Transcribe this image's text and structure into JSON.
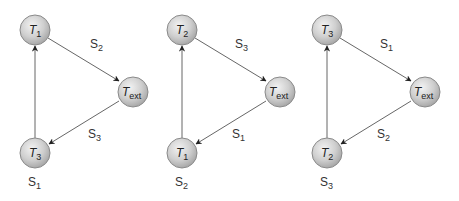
{
  "diagrams": [
    {
      "top": {
        "main": "T",
        "sub": "1"
      },
      "ext": {
        "main": "T",
        "sub": "ext"
      },
      "bottom": {
        "main": "T",
        "sub": "3"
      },
      "edge_top_ext": {
        "main": "S",
        "sub": "2"
      },
      "edge_ext_bottom": {
        "main": "S",
        "sub": "3"
      },
      "edge_bottom_top": {
        "main": "S",
        "sub": "1"
      }
    },
    {
      "top": {
        "main": "T",
        "sub": "2"
      },
      "ext": {
        "main": "T",
        "sub": "ext"
      },
      "bottom": {
        "main": "T",
        "sub": "1"
      },
      "edge_top_ext": {
        "main": "S",
        "sub": "3"
      },
      "edge_ext_bottom": {
        "main": "S",
        "sub": "1"
      },
      "edge_bottom_top": {
        "main": "S",
        "sub": "2"
      }
    },
    {
      "top": {
        "main": "T",
        "sub": "3"
      },
      "ext": {
        "main": "T",
        "sub": "ext"
      },
      "bottom": {
        "main": "T",
        "sub": "2"
      },
      "edge_top_ext": {
        "main": "S",
        "sub": "1"
      },
      "edge_ext_bottom": {
        "main": "S",
        "sub": "2"
      },
      "edge_bottom_top": {
        "main": "S",
        "sub": "3"
      }
    }
  ]
}
